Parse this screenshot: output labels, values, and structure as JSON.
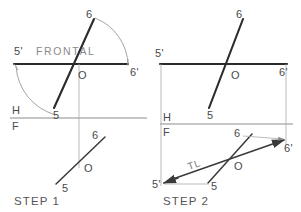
{
  "figure": {
    "title_visible": false,
    "background_color": "#ffffff",
    "ink_color": "#2b2b2b",
    "light_ink_color": "#9a9a9a"
  },
  "steps": [
    {
      "id": "step-1",
      "caption": "STEP 1",
      "caption_x": 14,
      "caption_y": 201,
      "plane_label": "FRONTAL",
      "plane_label_x": 36,
      "plane_label_y": 51,
      "fold_line": {
        "upper_label": "H",
        "lower_label": "F",
        "y": 118
      },
      "points": [
        {
          "name": "5'",
          "x": 16,
          "y": 51,
          "view": "horizontal-rotated"
        },
        {
          "name": "6'",
          "x": 132,
          "y": 72,
          "view": "horizontal-rotated"
        },
        {
          "name": "6",
          "x": 89,
          "y": 17,
          "view": "horizontal"
        },
        {
          "name": "5",
          "x": 55,
          "y": 115,
          "view": "horizontal"
        },
        {
          "name": "O",
          "x": 78,
          "y": 74,
          "view": "horizontal"
        },
        {
          "name": "6",
          "x": 92,
          "y": 139,
          "view": "frontal"
        },
        {
          "name": "O",
          "x": 92,
          "y": 170,
          "view": "frontal"
        },
        {
          "name": "5",
          "x": 62,
          "y": 188,
          "view": "frontal"
        }
      ]
    },
    {
      "id": "step-2",
      "caption": "STEP 2",
      "caption_x": 163,
      "caption_y": 201,
      "plane_label": "",
      "true_length_label": "TL",
      "fold_line": {
        "upper_label": "H",
        "lower_label": "F",
        "y": 124
      },
      "points": [
        {
          "name": "5'",
          "x": 158,
          "y": 53,
          "view": "horizontal-rotated"
        },
        {
          "name": "6'",
          "x": 281,
          "y": 72,
          "view": "horizontal-rotated"
        },
        {
          "name": "6",
          "x": 239,
          "y": 18,
          "view": "horizontal"
        },
        {
          "name": "5",
          "x": 208,
          "y": 115,
          "view": "horizontal"
        },
        {
          "name": "O",
          "x": 233,
          "y": 74,
          "view": "horizontal"
        },
        {
          "name": "6",
          "x": 236,
          "y": 137,
          "view": "frontal"
        },
        {
          "name": "6'",
          "x": 285,
          "y": 147,
          "view": "frontal-rotated"
        },
        {
          "name": "O",
          "x": 238,
          "y": 166,
          "view": "frontal"
        },
        {
          "name": "5",
          "x": 213,
          "y": 185,
          "view": "frontal"
        },
        {
          "name": "5'",
          "x": 155,
          "y": 182,
          "view": "frontal-rotated"
        }
      ]
    }
  ],
  "labels": {
    "point_5": "5",
    "point_6": "6",
    "point_5_prime": "5'",
    "point_6_prime": "6'",
    "point_O": "O",
    "plane_H": "H",
    "plane_F": "F",
    "frontal": "FRONTAL",
    "true_length": "TL",
    "step_one": "STEP 1",
    "step_two": "STEP 2"
  }
}
